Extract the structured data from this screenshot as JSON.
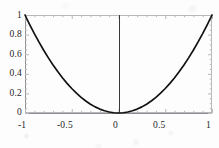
{
  "figure": {
    "background_color": "#fdfdfd",
    "frame_color": "#b9b9bd",
    "curve_color": "#121212",
    "axis_color": "#3a3a3a",
    "label_color": "#1d1d1d"
  },
  "chart_data": {
    "type": "line",
    "title": "",
    "xlabel": "",
    "ylabel": "",
    "xlim": [
      -1,
      1
    ],
    "ylim": [
      0,
      1
    ],
    "grid": false,
    "legend": null,
    "frame": true,
    "x_tick_labels": [
      "-1",
      "-0.5",
      "0",
      "0.5",
      "1"
    ],
    "x_ticks": [
      -1,
      -0.5,
      0,
      0.5,
      1
    ],
    "y_tick_labels": [
      "0",
      "0.2",
      "0.4",
      "0.6",
      "0.8",
      "1"
    ],
    "y_ticks": [
      0,
      0.2,
      0.4,
      0.6,
      0.8,
      1
    ],
    "series": [
      {
        "name": "y = x^2",
        "x": [
          -1,
          -0.95,
          -0.9,
          -0.85,
          -0.8,
          -0.75,
          -0.7,
          -0.65,
          -0.6,
          -0.55,
          -0.5,
          -0.45,
          -0.4,
          -0.35,
          -0.3,
          -0.25,
          -0.2,
          -0.15,
          -0.1,
          -0.05,
          0,
          0.05,
          0.1,
          0.15,
          0.2,
          0.25,
          0.3,
          0.35,
          0.4,
          0.45,
          0.5,
          0.55,
          0.6,
          0.65,
          0.7,
          0.75,
          0.8,
          0.85,
          0.9,
          0.95,
          1
        ],
        "y": [
          1,
          0.9025,
          0.81,
          0.7225,
          0.64,
          0.5625,
          0.49,
          0.4225,
          0.36,
          0.3025,
          0.25,
          0.2025,
          0.16,
          0.1225,
          0.09,
          0.0625,
          0.04,
          0.0225,
          0.01,
          0.0025,
          0,
          0.0025,
          0.01,
          0.0225,
          0.04,
          0.0625,
          0.09,
          0.1225,
          0.16,
          0.2025,
          0.25,
          0.3025,
          0.36,
          0.4225,
          0.49,
          0.5625,
          0.64,
          0.7225,
          0.81,
          0.9025,
          1
        ]
      }
    ],
    "annotations": [
      {
        "name": "vertical-axis-at-zero",
        "x": 0
      }
    ]
  },
  "labels": {
    "y": [
      {
        "text": "1",
        "left": 12,
        "top": 10
      },
      {
        "text": "0.8",
        "left": 0,
        "top": 29
      },
      {
        "text": "0.6",
        "left": 0,
        "top": 49
      },
      {
        "text": "0.4",
        "left": 0,
        "top": 68
      },
      {
        "text": "0.2",
        "left": 0,
        "top": 88
      },
      {
        "text": "0",
        "left": 12,
        "top": 107
      }
    ],
    "x": [
      {
        "text": "-1",
        "left": 18,
        "top": 120
      },
      {
        "text": "-0.5",
        "left": 57,
        "top": 120
      },
      {
        "text": "0",
        "left": 113,
        "top": 120
      },
      {
        "text": "0.5",
        "left": 153,
        "top": 120
      },
      {
        "text": "1",
        "left": 206,
        "top": 120
      }
    ]
  }
}
